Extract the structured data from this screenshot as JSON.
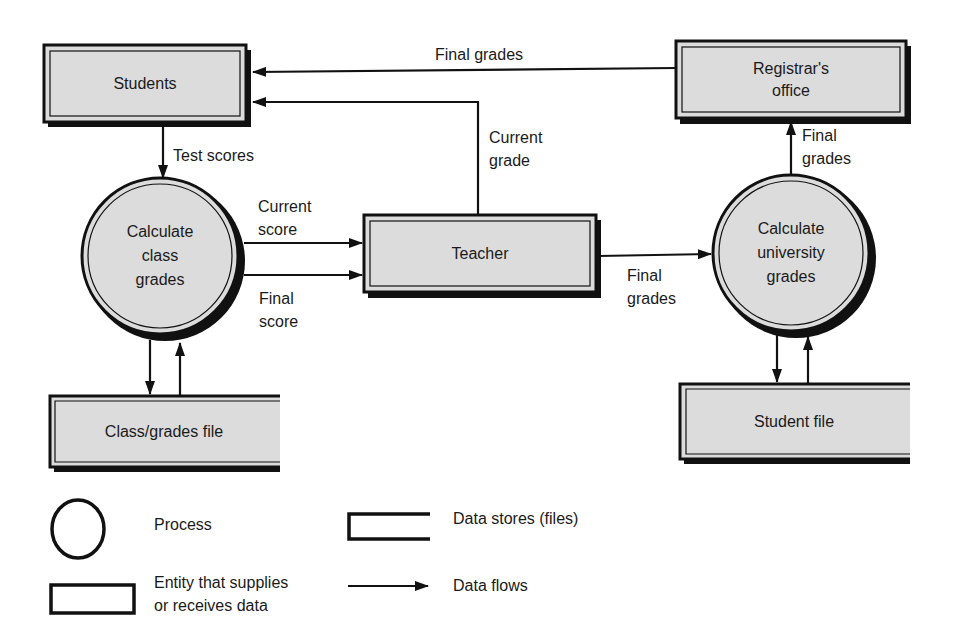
{
  "diagram": {
    "type": "data-flow-diagram",
    "colors": {
      "node_fill": "#dcdcdc",
      "stroke": "#111111",
      "background": "#ffffff"
    },
    "entities": {
      "students": "Students",
      "registrar_line1": "Registrar's",
      "registrar_line2": "office",
      "teacher": "Teacher"
    },
    "processes": {
      "class_grades_line1": "Calculate",
      "class_grades_line2": "class",
      "class_grades_line3": "grades",
      "university_grades_line1": "Calculate",
      "university_grades_line2": "university",
      "university_grades_line3": "grades"
    },
    "data_stores": {
      "class_grades_file": "Class/grades file",
      "student_file": "Student file"
    },
    "flows": {
      "registrar_to_students": "Final grades",
      "teacher_to_students_line1": "Current",
      "teacher_to_students_line2": "grade",
      "students_to_class_process": "Test scores",
      "current_score_line1": "Current",
      "current_score_line2": "score",
      "final_score_line1": "Final",
      "final_score_line2": "score",
      "teacher_to_university_line1": "Final",
      "teacher_to_university_line2": "grades",
      "university_to_registrar_line1": "Final",
      "university_to_registrar_line2": "grades"
    }
  },
  "legend": {
    "process": "Process",
    "data_stores": "Data stores (files)",
    "entity_line1": "Entity that supplies",
    "entity_line2": "or receives data",
    "data_flows": "Data flows"
  }
}
